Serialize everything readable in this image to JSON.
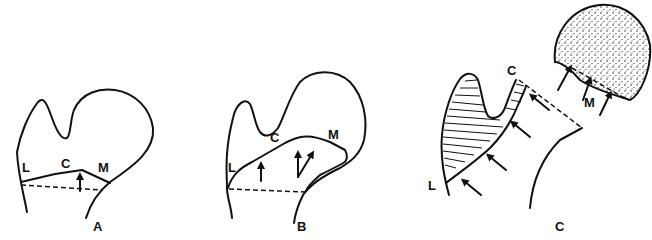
{
  "figure": {
    "panels": [
      {
        "id": "A",
        "caption": "A",
        "labels": {
          "lateral": "L",
          "central": "C",
          "medial": "M"
        }
      },
      {
        "id": "B",
        "caption": "B",
        "labels": {
          "lateral": "L",
          "central": "C",
          "medial": "M"
        }
      },
      {
        "id": "C",
        "caption": "C",
        "labels": {
          "lateral": "L",
          "central": "C",
          "medial": "M"
        }
      }
    ]
  }
}
